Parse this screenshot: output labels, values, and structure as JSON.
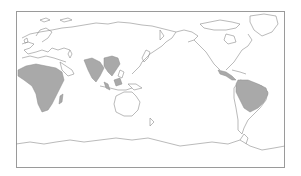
{
  "map": {
    "projection": "equirectangular, Pacific-centered",
    "frame": {
      "x": 16,
      "y": 11,
      "width": 269,
      "height": 157,
      "border_color": "#9a9a9a"
    },
    "colors": {
      "background": "#ffffff",
      "coastline": "#8c8c8c",
      "highlight_fill": "#a9a9a9"
    },
    "highlighted_regions": [
      {
        "name": "Sub-Saharan Africa"
      },
      {
        "name": "South and Southeast Asia"
      },
      {
        "name": "Central America"
      },
      {
        "name": "Northern South America / Brazil"
      }
    ],
    "legend": null,
    "title": null
  }
}
